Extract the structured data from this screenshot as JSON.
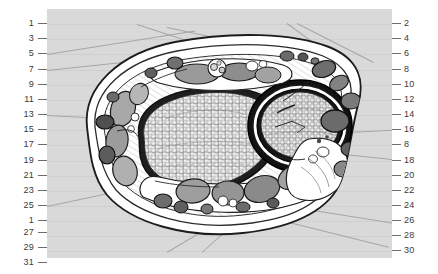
{
  "figure": {
    "panel_background": "#d9d9d9",
    "line_color": "#8a8a8a",
    "text_color": "#3a3a3a"
  },
  "labels": {
    "left": [
      {
        "id": "L1",
        "text": "1",
        "y": 24
      },
      {
        "id": "L2",
        "text": "3",
        "y": 39
      },
      {
        "id": "L3",
        "text": "5",
        "y": 54
      },
      {
        "id": "L4",
        "text": "7",
        "y": 70
      },
      {
        "id": "L5",
        "text": "9",
        "y": 85
      },
      {
        "id": "L6",
        "text": "11",
        "y": 100
      },
      {
        "id": "L7",
        "text": "13",
        "y": 115
      },
      {
        "id": "L8",
        "text": "15",
        "y": 130
      },
      {
        "id": "L9",
        "text": "17",
        "y": 145
      },
      {
        "id": "L10",
        "text": "19",
        "y": 161
      },
      {
        "id": "L11",
        "text": "21",
        "y": 176
      },
      {
        "id": "L12",
        "text": "23",
        "y": 191
      },
      {
        "id": "L13",
        "text": "25",
        "y": 206
      },
      {
        "id": "L14",
        "text": "1",
        "y": 221
      },
      {
        "id": "L15",
        "text": "27",
        "y": 232
      },
      {
        "id": "L16",
        "text": "29",
        "y": 247
      },
      {
        "id": "L17",
        "text": "31",
        "y": 262
      }
    ],
    "right": [
      {
        "id": "R1",
        "text": "2",
        "y": 24
      },
      {
        "id": "R2",
        "text": "4",
        "y": 39
      },
      {
        "id": "R3",
        "text": "6",
        "y": 54
      },
      {
        "id": "R4",
        "text": "8",
        "y": 70
      },
      {
        "id": "R5",
        "text": "10",
        "y": 85
      },
      {
        "id": "R6",
        "text": "12",
        "y": 100
      },
      {
        "id": "R7",
        "text": "14",
        "y": 115
      },
      {
        "id": "R8",
        "text": "16",
        "y": 130
      },
      {
        "id": "R9",
        "text": "8",
        "y": 145
      },
      {
        "id": "R10",
        "text": "18",
        "y": 161
      },
      {
        "id": "R11",
        "text": "20",
        "y": 176
      },
      {
        "id": "R12",
        "text": "22",
        "y": 191
      },
      {
        "id": "R13",
        "text": "24",
        "y": 206
      },
      {
        "id": "R14",
        "text": "26",
        "y": 221
      },
      {
        "id": "R15",
        "text": "28",
        "y": 236
      },
      {
        "id": "R16",
        "text": "30",
        "y": 251
      }
    ]
  }
}
